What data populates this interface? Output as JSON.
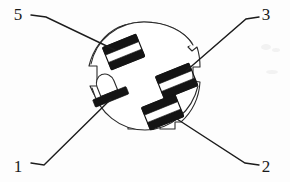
{
  "figure": {
    "background_color": "#fdfdfd",
    "line_color": "#2b2b2b",
    "contact_color": "#141414",
    "label_color": "#1a1a1a"
  },
  "callouts": [
    {
      "id": "callout-5",
      "label": "5",
      "label_x": 18,
      "label_y": 20,
      "leader": "M 31 15 L 46 17 L 115 50",
      "target": "upper-left-contact"
    },
    {
      "id": "callout-3",
      "label": "3",
      "label_x": 262,
      "label_y": 20,
      "leader": "M 259 17 L 246 19 L 186 71",
      "target": "right-upper-contact"
    },
    {
      "id": "callout-1",
      "label": "1",
      "label_x": 18,
      "label_y": 172,
      "leader": "M 31 163 L 44 165 L 111 99",
      "target": "pin-1-contact"
    },
    {
      "id": "callout-2",
      "label": "2",
      "label_x": 262,
      "label_y": 172,
      "leader": "M 259 165 L 245 163 L 177 119",
      "target": "right-lower-contact"
    }
  ],
  "connector": {
    "shell_name": "connector-shell",
    "center_x": 144,
    "center_y": 80,
    "radius_x": 56,
    "radius_y": 58,
    "notch_count": 4,
    "notch_positions": [
      "left",
      "top-right",
      "right",
      "bottom"
    ],
    "contacts": [
      {
        "name": "contact-group-5",
        "number": "5",
        "style": "double-bar",
        "center_x": 124,
        "center_y": 53,
        "rotation_deg": -22
      },
      {
        "name": "contact-group-3",
        "number": "3",
        "style": "double-bar",
        "center_x": 177,
        "center_y": 82,
        "rotation_deg": -22
      },
      {
        "name": "contact-group-2",
        "number": "2",
        "style": "double-bar",
        "center_x": 163,
        "center_y": 113,
        "rotation_deg": -22
      },
      {
        "name": "contact-group-1",
        "number": "1",
        "style": "single-bar-with-dome",
        "center_x": 110,
        "center_y": 95,
        "rotation_deg": -22
      }
    ]
  }
}
